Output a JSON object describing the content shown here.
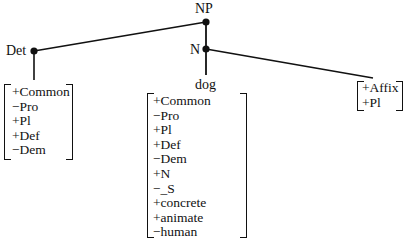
{
  "tree": {
    "root": {
      "label": "NP"
    },
    "det": {
      "label": "Det",
      "features": [
        "+Common",
        "−Pro",
        "+Pl",
        "+Def",
        "−Dem"
      ]
    },
    "n": {
      "label": "N",
      "noun": {
        "word": "dog",
        "features": [
          "+Common",
          "−Pro",
          "+Pl",
          "+Def",
          "−Dem",
          "+N",
          "−_S",
          "+concrete",
          "+animate",
          "−human"
        ]
      },
      "affix": {
        "features": [
          "+Affix",
          "+Pl"
        ]
      }
    }
  }
}
